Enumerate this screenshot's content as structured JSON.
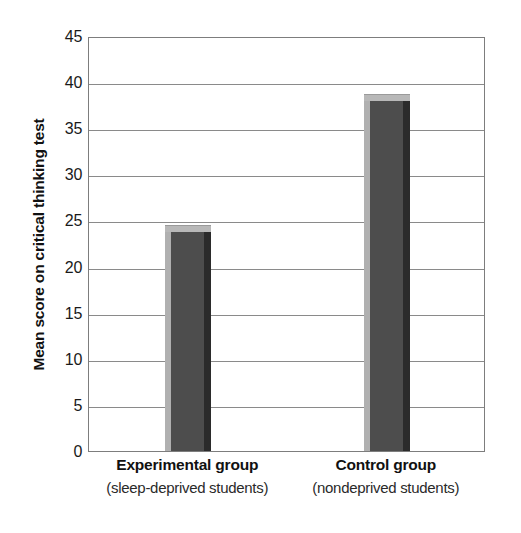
{
  "chart_data": {
    "type": "bar",
    "title": "",
    "subtitle": "",
    "xlabel": "",
    "ylabel": "Mean score on critical thinking test",
    "ylim": [
      0,
      45
    ],
    "ytick_step": 5,
    "yticks": [
      45,
      40,
      35,
      30,
      25,
      20,
      15,
      10,
      5,
      0
    ],
    "ytick_labels": [
      "45",
      "40",
      "35",
      "30",
      "25",
      "20",
      "15",
      "10",
      "5",
      "0"
    ],
    "grid": true,
    "legend": "none",
    "categories": [
      "Experimental group",
      "Control group"
    ],
    "category_sublabels": [
      "(sleep-deprived students)",
      "(nondeprived students)"
    ],
    "values": [
      24.5,
      38.7
    ],
    "bars": [
      {
        "category": "Experimental group",
        "sublabel": "(sleep-deprived students)",
        "value": 24.5
      },
      {
        "category": "Control group",
        "sublabel": "(nondeprived students)",
        "value": 38.7
      }
    ],
    "colors": {
      "bar_face": "#4d4d4d",
      "bar_highlight": "#b0b0b0",
      "bar_top": "#b8b8b8",
      "bar_shadow": "#2b2b2b",
      "gridline": "#8a8a8a",
      "axis": "#7d7d7d",
      "background": "#ffffff",
      "text": "#111111"
    }
  }
}
